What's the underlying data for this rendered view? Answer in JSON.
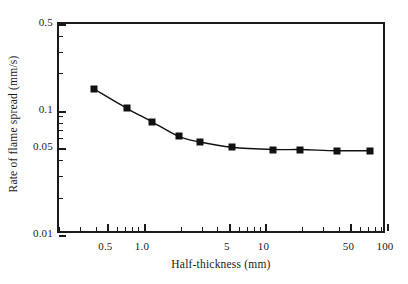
{
  "chart_data": {
    "type": "line",
    "title": "",
    "xlabel": "Half-thickness (mm)",
    "ylabel": "Rate of flame spread (mm/s)",
    "xscale": "log",
    "yscale": "log",
    "xlim": [
      0.2,
      100
    ],
    "ylim": [
      0.01,
      0.5
    ],
    "grid": false,
    "legend": null,
    "marker": "filled-square",
    "x_tick_labels": [
      "0.5",
      "1.0",
      "5",
      "10",
      "50",
      "100"
    ],
    "x_tick_values": [
      0.5,
      1.0,
      5,
      10,
      50,
      100
    ],
    "y_tick_labels": [
      "0.5",
      "0.1",
      "0.05",
      "0.01"
    ],
    "y_tick_values": [
      0.5,
      0.1,
      0.05,
      0.01
    ],
    "x": [
      0.4,
      0.75,
      1.2,
      2.0,
      3.0,
      5.5,
      12,
      20,
      40,
      75
    ],
    "values": [
      0.145,
      0.101,
      0.079,
      0.06,
      0.054,
      0.049,
      0.047,
      0.047,
      0.046,
      0.046
    ],
    "series": [
      {
        "name": "Rate of flame spread",
        "x": [
          0.4,
          0.75,
          1.2,
          2.0,
          3.0,
          5.5,
          12,
          20,
          40,
          75
        ],
        "values": [
          0.145,
          0.101,
          0.079,
          0.06,
          0.054,
          0.049,
          0.047,
          0.047,
          0.046,
          0.046
        ]
      }
    ]
  },
  "style": {
    "axis_color": "#1a1a1a",
    "line_color": "#111111",
    "marker_color": "#111111",
    "background": "#ffffff"
  }
}
